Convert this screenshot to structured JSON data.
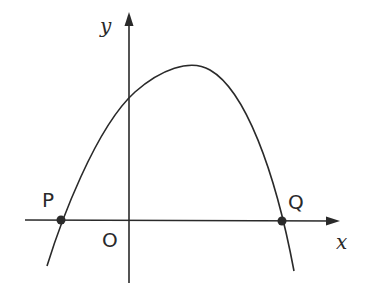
{
  "diagram": {
    "type": "graph of downward-opening parabola",
    "axes": {
      "x_label": "x",
      "y_label": "y",
      "origin_label": "O"
    },
    "points": [
      {
        "label": "P",
        "description": "left x-intercept"
      },
      {
        "label": "Q",
        "description": "right x-intercept"
      }
    ],
    "colors": {
      "stroke": "#2a2a2a",
      "background": "#ffffff"
    }
  }
}
